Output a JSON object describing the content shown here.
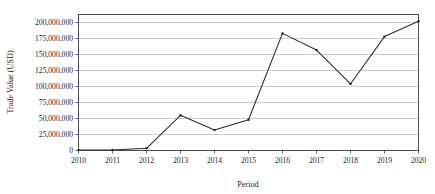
{
  "chart_data": {
    "type": "line",
    "title": "",
    "xlabel": "Period",
    "ylabel": "Trade Value (USD)",
    "categories": [
      "2010",
      "2011",
      "2012",
      "2013",
      "2014",
      "2015",
      "2016",
      "2017",
      "2018",
      "2019",
      "2020"
    ],
    "values": [
      700000,
      900000,
      3500000,
      55000000,
      32000000,
      48000000,
      183000000,
      157000000,
      104000000,
      178000000,
      202000000
    ],
    "series": [
      {
        "name": "Trade Value",
        "values": [
          700000,
          900000,
          3500000,
          55000000,
          32000000,
          48000000,
          183000000,
          157000000,
          104000000,
          178000000,
          202000000
        ]
      }
    ],
    "ylim": [
      0,
      212500000
    ],
    "xlim": [
      2010,
      2020
    ],
    "ytick_values": [
      0,
      25000000,
      50000000,
      75000000,
      100000000,
      125000000,
      150000000,
      175000000,
      200000000
    ],
    "ytick_labels": [
      "0",
      "25,000,000",
      "50,000,000",
      "75,000,000",
      "100,000,000",
      "125,000,000",
      "150,000,000",
      "175,000,000",
      "200,000,000"
    ],
    "xtick_labels": [
      "2010",
      "2011",
      "2012",
      "2013",
      "2014",
      "2015",
      "2016",
      "2017",
      "2018",
      "2019",
      "2020"
    ],
    "grid": "horizontal",
    "legend": "none",
    "marker": "square",
    "line_color": "#2b2b2b",
    "grid_color": "#b9b9b9",
    "background_color": "#ffffff"
  }
}
